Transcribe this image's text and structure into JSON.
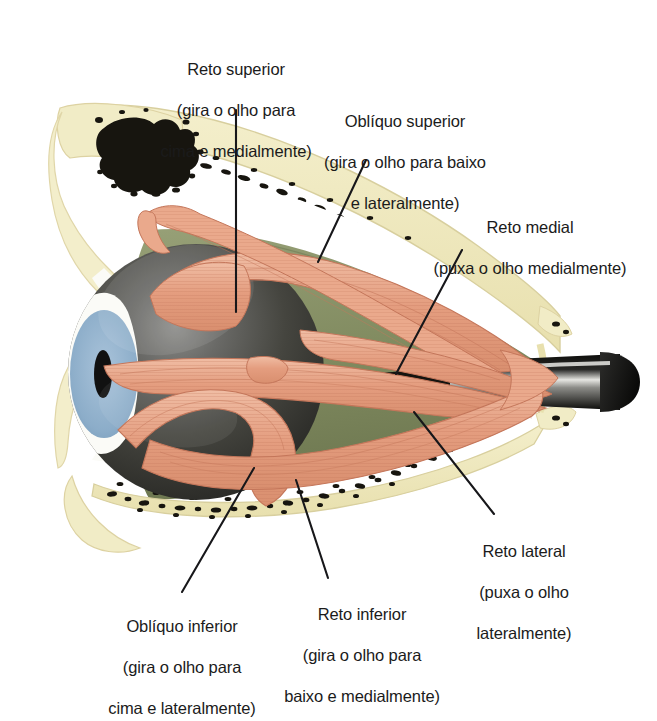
{
  "figure": {
    "background_color": "#ffffff"
  },
  "palette": {
    "bone_pale": "#efe9bd",
    "bone_edge": "#ddd3a0",
    "marrow_black": "#17150f",
    "orbital_fat": "#8a936a",
    "orbital_fat_dark": "#6f7a52",
    "muscle_salmon": "#e8a183",
    "muscle_light": "#f2c3ab",
    "muscle_line": "#c4765a",
    "globe_dark": "#3a3a38",
    "globe_highlight": "#8f8f8c",
    "iris_blue": "#8fb0cc",
    "pupil_black": "#111111",
    "sclera_white": "#fbfbf7",
    "nerve_dark": "#14130f",
    "nerve_highlight": "#d8d8d4",
    "leader_line": "#17171a",
    "label_text": "#1b1b1b"
  },
  "labels": [
    {
      "id": "reto-superior",
      "name": "Reto superior",
      "action": "(gira o olho para\ncima e medialmente)",
      "line1": "Reto superior",
      "line2": "(gira o olho para",
      "line3": "cima e medialmente)"
    },
    {
      "id": "obliquo-superior",
      "name": "Obliquo superior",
      "line1": "Oblíquo superior",
      "line2": "(gira o olho para baixo",
      "line3": "e lateralmente)"
    },
    {
      "id": "reto-medial",
      "name": "Reto medial",
      "line1": "Reto medial",
      "line2": "(puxa o olho medialmente)",
      "line3": ""
    },
    {
      "id": "reto-lateral",
      "name": "Reto lateral",
      "line1": "Reto lateral",
      "line2": "(puxa o olho",
      "line3": "lateralmente)"
    },
    {
      "id": "reto-inferior",
      "name": "Reto inferior",
      "line1": "Reto inferior",
      "line2": "(gira o olho para",
      "line3": "baixo e medialmente)"
    },
    {
      "id": "obliquo-inferior",
      "name": "Obliquo inferior",
      "line1": "Oblíquo inferior",
      "line2": "(gira o olho para",
      "line3": "cima e lateralmente)"
    }
  ],
  "structures": [
    {
      "id": "frontal-bone",
      "label": "Osso frontal / orbita superior"
    },
    {
      "id": "marrow-cavity",
      "label": "Cavidade medular"
    },
    {
      "id": "orbital-fat",
      "label": "Gordura orbital"
    },
    {
      "id": "eyeball",
      "label": "Bulbo do olho"
    },
    {
      "id": "iris",
      "label": "Iris"
    },
    {
      "id": "pupil",
      "label": "Pupila"
    },
    {
      "id": "optic-nerve",
      "label": "Nervo optico"
    },
    {
      "id": "maxilla-bone",
      "label": "Assoalho da orbita"
    },
    {
      "id": "eyelid-upper",
      "label": "Palpebra superior"
    },
    {
      "id": "eyelid-lower",
      "label": "Palpebra inferior"
    }
  ]
}
